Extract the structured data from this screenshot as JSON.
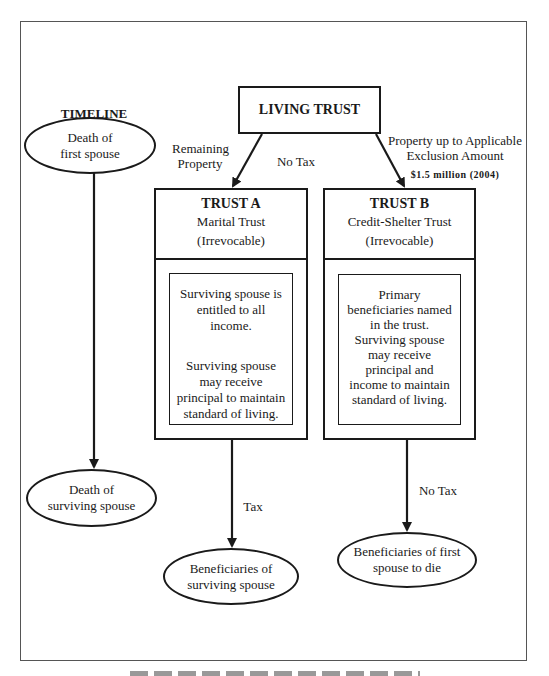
{
  "diagram": {
    "timeline": {
      "heading": "TIMELINE",
      "start_event": "Death of first spouse",
      "start_lines": [
        "Death of",
        "first spouse"
      ],
      "end_event": "Death of surviving spouse",
      "end_lines": [
        "Death of",
        "surviving spouse"
      ]
    },
    "root": {
      "label": "LIVING TRUST"
    },
    "edges": {
      "to_trust_a": {
        "label_lines": [
          "Remaining",
          "Property"
        ]
      },
      "middle_label": "No Tax",
      "to_trust_b": {
        "label_lines": [
          "Property up to Applicable",
          "Exclusion Amount"
        ],
        "amount": "$1.5 million (2004)"
      },
      "trust_a_out": {
        "label": "Tax"
      },
      "trust_b_out": {
        "label": "No Tax"
      }
    },
    "trust_a": {
      "title": "TRUST A",
      "subtitle": "Marital Trust",
      "type": "(Irrevocable)",
      "body_1_lines": [
        "Surviving spouse is",
        "entitled to all",
        "income."
      ],
      "body_2_lines": [
        "Surviving spouse",
        "may receive",
        "principal to maintain",
        "standard of living."
      ]
    },
    "trust_b": {
      "title": "TRUST B",
      "subtitle": "Credit-Shelter Trust",
      "type": "(Irrevocable)",
      "body_lines": [
        "Primary",
        "beneficiaries named",
        "in the trust.",
        "Surviving spouse",
        "may receive",
        "principal and",
        "income to maintain",
        "standard of living."
      ]
    },
    "outcomes": {
      "trust_a_lines": [
        "Beneficiaries of",
        "surviving spouse"
      ],
      "trust_b_lines": [
        "Beneficiaries of first",
        "spouse to die"
      ]
    },
    "colors": {
      "stroke": "#1a1a1a",
      "frame": "#555555",
      "background": "#ffffff"
    }
  }
}
